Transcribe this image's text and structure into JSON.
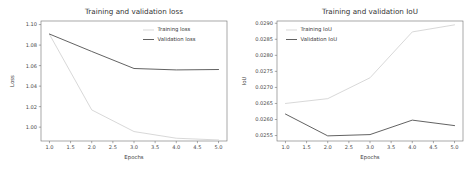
{
  "figure": {
    "background_color": "#ffffff",
    "panel_count": 2
  },
  "chart_data": [
    {
      "type": "line",
      "title": "Training and validation loss",
      "xlabel": "Epochs",
      "ylabel": "Loss",
      "x": [
        1,
        2,
        3,
        4,
        5
      ],
      "xlim": [
        0.8,
        5.2
      ],
      "ylim": [
        0.9865,
        1.1035
      ],
      "xticks": [
        1.0,
        1.5,
        2.0,
        2.5,
        3.0,
        3.5,
        4.0,
        4.5,
        5.0
      ],
      "xtick_labels": [
        "1.0",
        "1.5",
        "2.0",
        "2.5",
        "3.0",
        "3.5",
        "4.0",
        "4.5",
        "5.0"
      ],
      "yticks": [
        1.0,
        1.02,
        1.04,
        1.06,
        1.08,
        1.1
      ],
      "ytick_labels": [
        "1.00",
        "1.02",
        "1.04",
        "1.06",
        "1.08",
        "1.10"
      ],
      "grid": false,
      "legend_position": "upper right",
      "series": [
        {
          "name": "Training loss",
          "color": "#d6d6d6",
          "values": [
            1.0905,
            1.0168,
            0.9957,
            0.9892,
            0.9875
          ]
        },
        {
          "name": "Validation loss",
          "color": "#5a5a5a",
          "values": [
            1.0908,
            1.0738,
            1.0572,
            1.0558,
            1.0562
          ]
        }
      ]
    },
    {
      "type": "line",
      "title": "Training and validation IoU",
      "xlabel": "Epochs",
      "ylabel": "IoU",
      "x": [
        1,
        2,
        3,
        4,
        5
      ],
      "xlim": [
        0.8,
        5.2
      ],
      "ylim": [
        0.02533,
        0.02907
      ],
      "xticks": [
        1.0,
        1.5,
        2.0,
        2.5,
        3.0,
        3.5,
        4.0,
        4.5,
        5.0
      ],
      "xtick_labels": [
        "1.0",
        "1.5",
        "2.0",
        "2.5",
        "3.0",
        "3.5",
        "4.0",
        "4.5",
        "5.0"
      ],
      "yticks": [
        0.0255,
        0.026,
        0.0265,
        0.027,
        0.0275,
        0.028,
        0.0285,
        0.029
      ],
      "ytick_labels": [
        "0.0255",
        "0.0260",
        "0.0265",
        "0.0270",
        "0.0275",
        "0.0280",
        "0.0285",
        "0.0290"
      ],
      "grid": false,
      "legend_position": "upper left",
      "series": [
        {
          "name": "Training IoU",
          "color": "#d6d6d6",
          "values": [
            0.0265,
            0.02665,
            0.0273,
            0.02873,
            0.02895
          ]
        },
        {
          "name": "Validation IoU",
          "color": "#5a5a5a",
          "values": [
            0.02617,
            0.02549,
            0.02553,
            0.02598,
            0.02581
          ]
        }
      ]
    }
  ]
}
